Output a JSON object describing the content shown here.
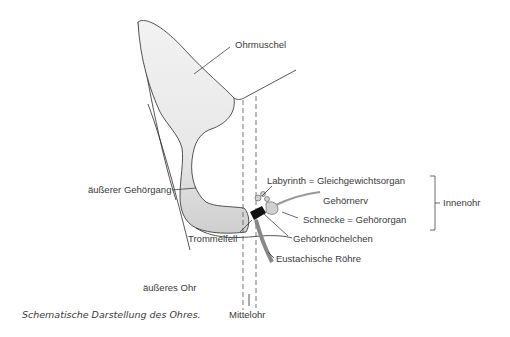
{
  "diagram": {
    "title": "Schematische Darstellung des Ohres.",
    "labels": {
      "ohrmuschel": "Ohrmuschel",
      "aeusserer_gehoergang": "äußerer Gehörgang",
      "trommelfell": "Trommelfell",
      "labyrinth": "Labyrinth = Gleichgewichtsorgan",
      "gehoernerv": "Gehörnerv",
      "schnecke": "Schnecke = Gehörorgan",
      "gehoerknoechelchen": "Gehörknöchelchen",
      "eustachische_roehre": "Eustachische Röhre",
      "innenohr": "Innenohr",
      "aeusseres_ohr": "äußeres Ohr",
      "mittelohr": "Mittelohr"
    },
    "colors": {
      "line": "#2a2a2a",
      "fill": "#e6e6e6",
      "dark_fill": "#b8b8b8",
      "text": "#3a3a3a"
    }
  }
}
